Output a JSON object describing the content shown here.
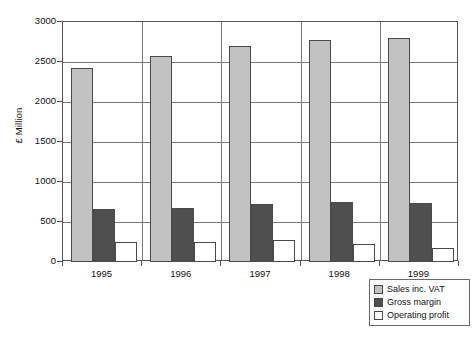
{
  "chart_data": {
    "type": "bar",
    "title": "",
    "xlabel": "",
    "ylabel": "£ Million",
    "categories": [
      "1995",
      "1996",
      "1997",
      "1998",
      "1999"
    ],
    "series": [
      {
        "name": "Sales inc. VAT",
        "values": [
          2430,
          2580,
          2700,
          2780,
          2800
        ],
        "color": "#c2c2c2"
      },
      {
        "name": "Gross margin",
        "values": [
          660,
          680,
          730,
          750,
          740
        ],
        "color": "#4f4f4f"
      },
      {
        "name": "Operating profit",
        "values": [
          250,
          250,
          270,
          230,
          170
        ],
        "color": "#ffffff"
      }
    ],
    "ylim": [
      0,
      3000
    ],
    "yticks": [
      0,
      500,
      1000,
      1500,
      2000,
      2500,
      3000
    ],
    "ytick_labels": [
      "0",
      "500",
      "1000",
      "1500",
      "2000",
      "2500",
      "3000"
    ],
    "grid": true,
    "legend_position": "bottom-right",
    "legend_entries": [
      "Sales inc. VAT",
      "Gross margin",
      "Operating profit"
    ]
  },
  "legend": {
    "items": [
      {
        "label": "Sales inc. VAT",
        "swatch": "#c2c2c2"
      },
      {
        "label": "Gross margin",
        "swatch": "#4f4f4f"
      },
      {
        "label": "Operating profit",
        "swatch": "#ffffff"
      }
    ]
  },
  "axes": {
    "y_title": "£ Million"
  }
}
